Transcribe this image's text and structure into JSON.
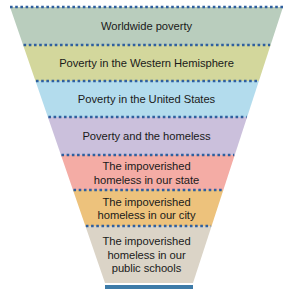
{
  "diagram": {
    "type": "funnel",
    "background_color": "#ffffff",
    "divider_color": "#2f5f9e",
    "base_bar_color": "#3d7ba8",
    "text_color": "#1a1a1a",
    "bands": [
      {
        "id": "worldwide-poverty",
        "label": "Worldwide poverty",
        "color": "#b9cdbd",
        "top": 7,
        "bottom": 45
      },
      {
        "id": "poverty-western-hemisphere",
        "label": "Poverty in the Western Hemisphere",
        "color": "#d3d79c",
        "top": 45,
        "bottom": 81
      },
      {
        "id": "poverty-united-states",
        "label": "Poverty in the United States",
        "color": "#b3dced",
        "top": 81,
        "bottom": 117
      },
      {
        "id": "poverty-and-homeless",
        "label": "Poverty and the homeless",
        "color": "#cbc0dc",
        "top": 117,
        "bottom": 155
      },
      {
        "id": "impoverished-homeless-state",
        "label": "The impoverished\nhomeless in our state",
        "color": "#f4aca5",
        "top": 155,
        "bottom": 190
      },
      {
        "id": "impoverished-homeless-city",
        "label": "The impoverished\nhomeless in our city",
        "color": "#edc27c",
        "top": 190,
        "bottom": 226
      },
      {
        "id": "impoverished-homeless-public-schools",
        "label": "The impoverished\nhomeless in our\npublic schools",
        "color": "#dbd4c7",
        "top": 226,
        "bottom": 283
      }
    ],
    "geometry": {
      "top_left_x": 10,
      "top_right_x": 283,
      "bottom_left_x": 105,
      "bottom_right_x": 193,
      "top_y": 7,
      "bottom_y": 283,
      "base_bar_y": 285,
      "base_bar_height": 4
    }
  },
  "chart_data": {
    "type": "funnel",
    "stages": [
      "Worldwide poverty",
      "Poverty in the Western Hemisphere",
      "Poverty in the United States",
      "Poverty and the homeless",
      "The impoverished homeless in our state",
      "The impoverished homeless in our city",
      "The impoverished homeless in our public schools"
    ],
    "widths": [
      273,
      242,
      208,
      174,
      138,
      105,
      71
    ],
    "xlabel": "",
    "ylabel": "",
    "legend": "none",
    "grid": false
  }
}
